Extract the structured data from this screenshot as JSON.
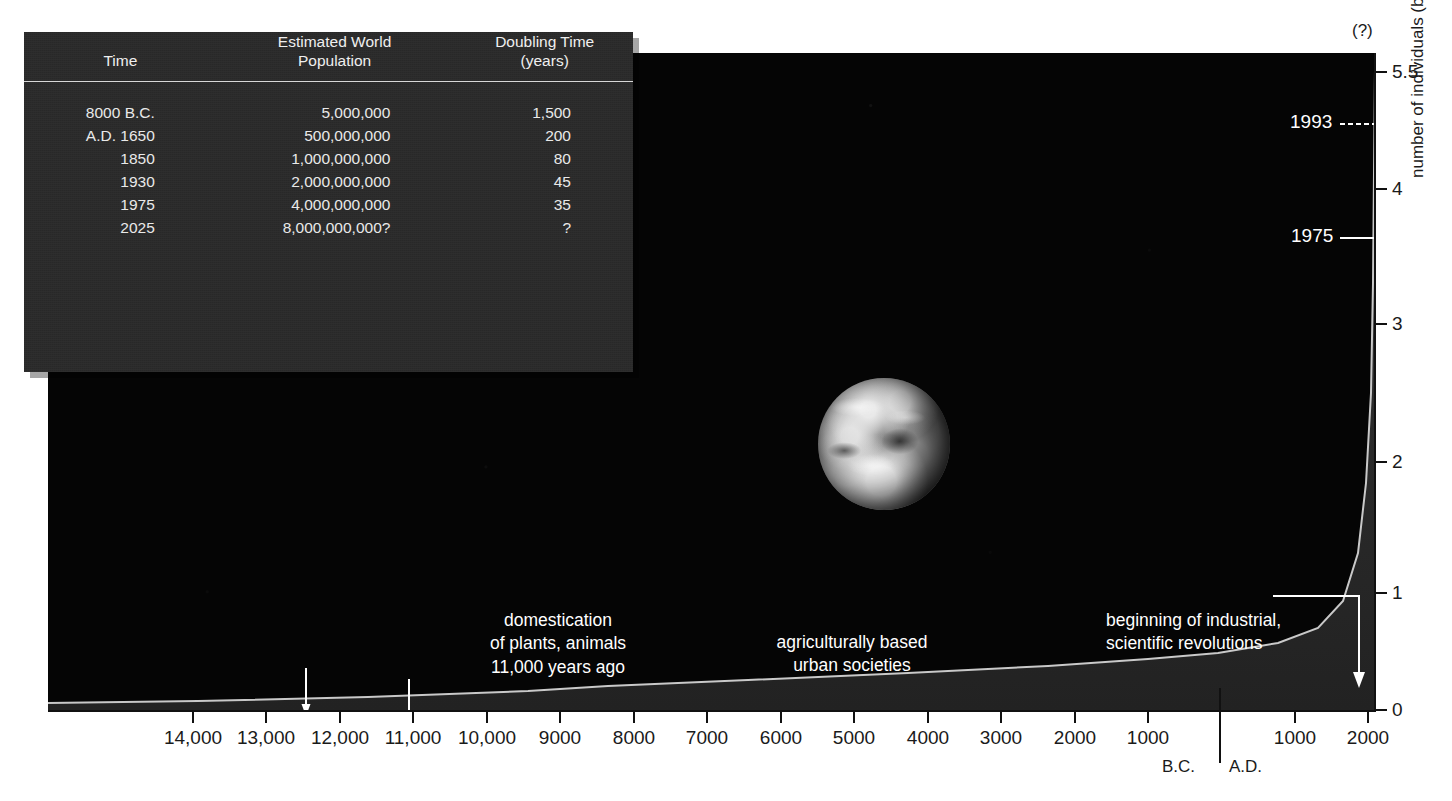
{
  "chart_data": {
    "type": "area",
    "xlabel": "",
    "ylabel": "number of individuals (billions)",
    "ylim": [
      0,
      5.5
    ],
    "y_ticks": [
      {
        "value": 0,
        "label": "0",
        "y": 710
      },
      {
        "value": 1,
        "label": "1",
        "y": 593
      },
      {
        "value": 2,
        "label": "2",
        "y": 462
      },
      {
        "value": 3,
        "label": "3",
        "y": 324
      },
      {
        "value": 4,
        "label": "4",
        "y": 189
      },
      {
        "value": 5.5,
        "label": "5.5",
        "y": 72
      }
    ],
    "y_axis_top_note": "(?)",
    "x_ticks": [
      {
        "label": "14,000",
        "x": 193
      },
      {
        "label": "13,000",
        "x": 266
      },
      {
        "label": "12,000",
        "x": 340
      },
      {
        "label": "11,000",
        "x": 413
      },
      {
        "label": "10,000",
        "x": 487
      },
      {
        "label": "9000",
        "x": 560
      },
      {
        "label": "8000",
        "x": 634
      },
      {
        "label": "7000",
        "x": 707
      },
      {
        "label": "6000",
        "x": 781
      },
      {
        "label": "5000",
        "x": 854
      },
      {
        "label": "4000",
        "x": 928
      },
      {
        "label": "3000",
        "x": 1001
      },
      {
        "label": "2000",
        "x": 1075
      },
      {
        "label": "1000",
        "x": 1148
      },
      {
        "label": "1000",
        "x": 1295
      },
      {
        "label": "2000",
        "x": 1368
      }
    ],
    "era_labels": {
      "bc": "B.C.",
      "ad": "A.D."
    },
    "grid": false,
    "legend": "none",
    "series": [
      {
        "name": "world population",
        "points": [
          {
            "x_label": "14,000 B.C.",
            "value": 0.003
          },
          {
            "x_label": "11,000 B.C.",
            "value": 0.005
          },
          {
            "x_label": "8000 B.C.",
            "value": 0.005
          },
          {
            "x_label": "5000 B.C.",
            "value": 0.02
          },
          {
            "x_label": "3000 B.C.",
            "value": 0.05
          },
          {
            "x_label": "1000 B.C.",
            "value": 0.1
          },
          {
            "x_label": "A.D. 1",
            "value": 0.2
          },
          {
            "x_label": "A.D. 1000",
            "value": 0.3
          },
          {
            "x_label": "A.D. 1650",
            "value": 0.5
          },
          {
            "x_label": "A.D. 1850",
            "value": 1.0
          },
          {
            "x_label": "A.D. 1930",
            "value": 2.0
          },
          {
            "x_label": "A.D. 1975",
            "value": 4.0
          },
          {
            "x_label": "A.D. 1993",
            "value": 5.5
          }
        ]
      }
    ],
    "callouts": [
      {
        "name": "1993",
        "label": "1993",
        "value": 5.5
      },
      {
        "name": "1975",
        "label": "1975",
        "value": 4
      }
    ],
    "annotations": [
      {
        "name": "domestication",
        "lines": [
          "domestication",
          "of plants, animals",
          "11,000 years ago"
        ],
        "text": "domestication\nof plants, animals\n11,000 years ago"
      },
      {
        "name": "urban-societies",
        "lines": [
          "agriculturally based",
          "urban societies"
        ],
        "text": "agriculturally based\nurban societies"
      },
      {
        "name": "industrial-revolution",
        "lines": [
          "beginning of industrial,",
          "scientific revolutions"
        ],
        "text": "beginning of industrial,\nscientific revolutions"
      }
    ]
  },
  "data_table": {
    "headers": {
      "time": "Time",
      "population_line1": "Estimated World",
      "population_line2": "Population",
      "doubling_line1": "Doubling Time",
      "doubling_line2": "(years)"
    },
    "rows": [
      {
        "time": "8000 B.C.",
        "population": "5,000,000",
        "doubling": "1,500"
      },
      {
        "time": "A.D. 1650",
        "population": "500,000,000",
        "doubling": "200"
      },
      {
        "time": "1850",
        "population": "1,000,000,000",
        "doubling": "80"
      },
      {
        "time": "1930",
        "population": "2,000,000,000",
        "doubling": "45"
      },
      {
        "time": "1975",
        "population": "4,000,000,000",
        "doubling": "35"
      },
      {
        "time": "2025",
        "population": "8,000,000,000?",
        "doubling": "?"
      }
    ]
  },
  "colors": {
    "plot_background": "#050505",
    "curve_fill": "#2a2a2a",
    "curve_edge": "#b8b8b8",
    "table_panel": "#2b2b2b",
    "text_light": "#e9e9e9",
    "axis": "#111111",
    "page_background": "#ffffff"
  },
  "icons": {
    "earth": "earth-globe-photo"
  }
}
